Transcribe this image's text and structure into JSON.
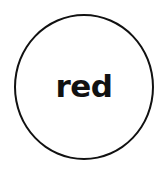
{
  "diagram": {
    "nodes": [
      {
        "shape": "circle",
        "label": "red",
        "stroke": "#111111",
        "fill": "#ffffff"
      }
    ]
  }
}
